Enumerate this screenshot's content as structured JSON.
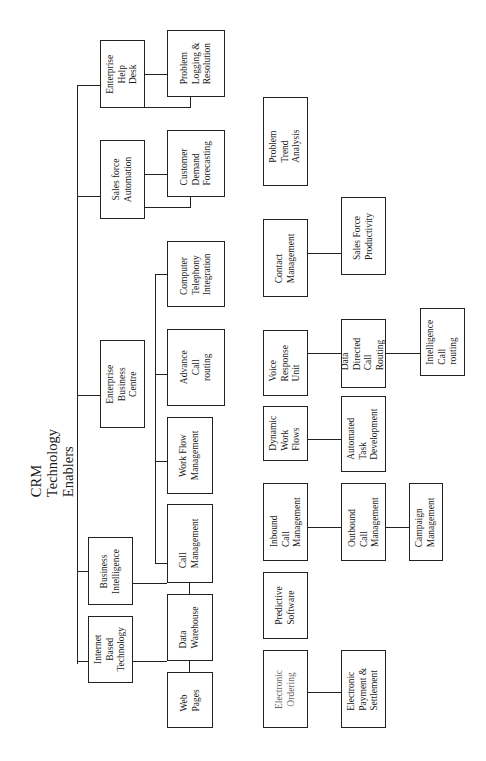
{
  "diagram": {
    "title": "CRM\nTechnology\nEnablers",
    "type": "hierarchy-tree",
    "orientation": "rotated-90-ccw",
    "tree": {
      "root": "CRM Technology Enablers",
      "children": [
        {
          "label": "Enterprise\nHelp\nDesk",
          "children": [
            {
              "label": "Problem\nLogging &\nResolution"
            }
          ]
        },
        {
          "label": "Sales force\nAutomation",
          "children": [
            {
              "label": "Customer\nDemand\nForecasting"
            }
          ]
        },
        {
          "label": "Enterprise\nBusiness\nCentre",
          "children": [
            {
              "label": "Computer\nTelephony\nIntegration"
            },
            {
              "label": "Advance\nCall\nrouting"
            },
            {
              "label": "Work Flow\nManagement"
            },
            {
              "label": "Call\nManagement"
            }
          ]
        },
        {
          "label": "Business\nIntelligence",
          "children": [
            {
              "label": "Data\nWarehouse"
            }
          ]
        },
        {
          "label": "Internet\nBased\nTechnology",
          "children": [
            {
              "label": "Web\nPages"
            }
          ]
        }
      ]
    },
    "loose_groups": [
      {
        "items": [
          "Problem Trend\nAnalysis"
        ]
      },
      {
        "items": [
          "Contact\nManagement",
          "Sales Force\nProductivity"
        ]
      },
      {
        "items": [
          "Voice\nResponse\nUnit",
          "Data\nDirected\nCall\nRouting",
          "Intelligence\nCall routing"
        ]
      },
      {
        "items": [
          "Dynamic\nWork\nFlows",
          "Automated\nTask\nDevelopment"
        ]
      },
      {
        "items": [
          "Inbound Call\nManagement",
          "Outbound Call\nManagement",
          "Campaign\nManagement"
        ]
      },
      {
        "items": [
          "Predictive\nSoftware"
        ]
      },
      {
        "items": [
          "Electronic\nOrdering",
          "Electronic\nPayment &\nSettlement"
        ]
      }
    ]
  },
  "labels": {
    "help_desk": "Enterprise\nHelp\nDesk",
    "problem_logging": "Problem\nLogging &\nResolution",
    "sales_force_automation": "Sales force\nAutomation",
    "customer_demand": "Customer\nDemand\nForecasting",
    "cti": "Computer\nTelephony\nIntegration",
    "advance_call": "Advance\nCall\nrouting",
    "ebc": "Enterprise\nBusiness\nCentre",
    "work_flow": "Work Flow\nManagement",
    "call_mgmt": "Call\nManagement",
    "business_intel": "Business\nIntelligence",
    "data_warehouse": "Data\nWarehouse",
    "internet_tech": "Internet\nBased\nTechnology",
    "web_pages": "Web\nPages",
    "problem_trend": "Problem Trend\nAnalysis",
    "contact_mgmt": "Contact\nManagement",
    "sales_productivity": "Sales Force\nProductivity",
    "voice_response": "Voice\nResponse\nUnit",
    "data_directed": "Data\nDirected\nCall\nRouting",
    "intelligence_routing": "Intelligence\nCall routing",
    "dynamic_flows": "Dynamic\nWork\nFlows",
    "automated_task": "Automated\nTask\nDevelopment",
    "inbound": "Inbound Call\nManagement",
    "outbound": "Outbound Call\nManagement",
    "campaign": "Campaign\nManagement",
    "predictive": "Predictive\nSoftware",
    "e_ordering": "Electronic\nOrdering",
    "e_payment": "Electronic\nPayment &\nSettlement"
  }
}
